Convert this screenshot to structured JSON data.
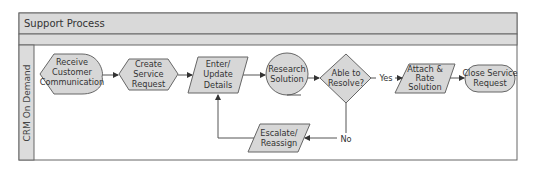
{
  "pool": {
    "title": "Support Process",
    "lane_label": "CRM On Demand"
  },
  "nodes": {
    "receive": {
      "shape": "display",
      "lines": [
        "Receive",
        "Customer",
        "Communication"
      ]
    },
    "create": {
      "shape": "hexagon",
      "lines": [
        "Create",
        "Service",
        "Request"
      ]
    },
    "enter": {
      "shape": "parallelogram",
      "lines": [
        "Enter/",
        "Update",
        "Details"
      ]
    },
    "research": {
      "shape": "circle-tape",
      "lines": [
        "Research",
        "Solution"
      ]
    },
    "decision": {
      "shape": "diamond",
      "lines": [
        "Able to",
        "Resolve?"
      ]
    },
    "attach": {
      "shape": "parallelogram",
      "lines": [
        "Attach &",
        "Rate",
        "Solution"
      ]
    },
    "close": {
      "shape": "terminator",
      "lines": [
        "Close Service",
        "Request"
      ]
    },
    "escalate": {
      "shape": "parallelogram",
      "lines": [
        "Escalate/",
        "Reassign"
      ]
    }
  },
  "edges": {
    "yes_label": "Yes",
    "no_label": "No"
  },
  "colors": {
    "shape_fill": "#d7d7d7",
    "header_fill": "#d9d9d9",
    "stroke": "#666666"
  }
}
